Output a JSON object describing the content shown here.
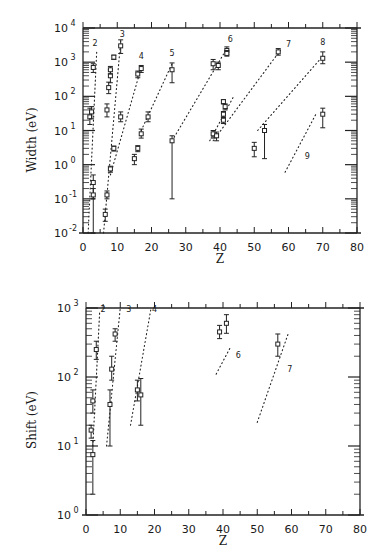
{
  "chart_data": [
    {
      "type": "scatter",
      "title": "",
      "xlabel": "Z",
      "ylabel": "Width (eV)",
      "xlim": [
        0,
        80
      ],
      "ylim": [
        0.01,
        10000
      ],
      "yscale": "log",
      "x_ticks": [
        "0",
        "10",
        "20",
        "30",
        "40",
        "50",
        "60",
        "70",
        "80"
      ],
      "y_ticks": [
        "10^-2",
        "10^-1",
        "10^0",
        "10^1",
        "10^2",
        "10^3",
        "10^4"
      ],
      "grid": false,
      "curve_labels": [
        "2",
        "3",
        "4",
        "5",
        "6",
        "7",
        "8",
        "9"
      ],
      "series": [
        {
          "name": "data",
          "points": [
            {
              "z": 2,
              "y": 25,
              "lo": 15,
              "hi": 45
            },
            {
              "z": 2.5,
              "y": 35,
              "lo": 22,
              "hi": 50
            },
            {
              "z": 3,
              "y": 700,
              "lo": 500,
              "hi": 900
            },
            {
              "z": 3,
              "y": 0.3,
              "lo": 0.1,
              "hi": 0.5
            },
            {
              "z": 3,
              "y": 0.13,
              "lo": 0.01,
              "hi": 0.2
            },
            {
              "z": 6.5,
              "y": 0.035,
              "lo": 0.022,
              "hi": 0.05
            },
            {
              "z": 7,
              "y": 0.13,
              "lo": 0.1,
              "hi": 0.17
            },
            {
              "z": 7,
              "y": 40,
              "lo": 25,
              "hi": 60
            },
            {
              "z": 7.5,
              "y": 180,
              "lo": 120,
              "hi": 260
            },
            {
              "z": 8,
              "y": 0.75,
              "lo": 0.6,
              "hi": 0.9
            },
            {
              "z": 8,
              "y": 400,
              "lo": 250,
              "hi": 600
            },
            {
              "z": 8,
              "y": 600,
              "lo": 450,
              "hi": 750
            },
            {
              "z": 9,
              "y": 1400,
              "lo": 1200,
              "hi": 1600
            },
            {
              "z": 9,
              "y": 3,
              "lo": 2.5,
              "hi": 3.5
            },
            {
              "z": 11,
              "y": 3000,
              "lo": 1800,
              "hi": 4500
            },
            {
              "z": 11,
              "y": 25,
              "lo": 18,
              "hi": 35
            },
            {
              "z": 15,
              "y": 1.5,
              "lo": 1,
              "hi": 2
            },
            {
              "z": 16,
              "y": 3,
              "lo": 2.4,
              "hi": 3.6
            },
            {
              "z": 17,
              "y": 8,
              "lo": 6,
              "hi": 11
            },
            {
              "z": 16,
              "y": 450,
              "lo": 350,
              "hi": 550
            },
            {
              "z": 17,
              "y": 650,
              "lo": 500,
              "hi": 800
            },
            {
              "z": 19,
              "y": 25,
              "lo": 18,
              "hi": 35
            },
            {
              "z": 26,
              "y": 5,
              "lo": 0.1,
              "hi": 7
            },
            {
              "z": 26,
              "y": 600,
              "lo": 250,
              "hi": 950
            },
            {
              "z": 38,
              "y": 8,
              "lo": 6,
              "hi": 10
            },
            {
              "z": 39,
              "y": 7,
              "lo": 5,
              "hi": 9
            },
            {
              "z": 38,
              "y": 900,
              "lo": 600,
              "hi": 1200
            },
            {
              "z": 39.5,
              "y": 800,
              "lo": 600,
              "hi": 1000
            },
            {
              "z": 41,
              "y": 70,
              "lo": 60,
              "hi": 80
            },
            {
              "z": 41.5,
              "y": 50,
              "lo": 40,
              "hi": 60
            },
            {
              "z": 41,
              "y": 30,
              "lo": 25,
              "hi": 36
            },
            {
              "z": 41,
              "y": 20,
              "lo": 16,
              "hi": 24
            },
            {
              "z": 42,
              "y": 2200,
              "lo": 1700,
              "hi": 2800
            },
            {
              "z": 42,
              "y": 1800,
              "lo": 1500,
              "hi": 2200
            },
            {
              "z": 50,
              "y": 3,
              "lo": 1.7,
              "hi": 4.5
            },
            {
              "z": 53,
              "y": 10,
              "lo": 1.5,
              "hi": 15
            },
            {
              "z": 57,
              "y": 2000,
              "lo": 1600,
              "hi": 2500
            },
            {
              "z": 70,
              "y": 1300,
              "lo": 900,
              "hi": 2000
            },
            {
              "z": 70,
              "y": 30,
              "lo": 12,
              "hi": 45
            }
          ]
        },
        {
          "name": "curve-2",
          "style": "dotted",
          "points": [
            [
              1.5,
              0.01
            ],
            [
              4,
              2000
            ]
          ]
        },
        {
          "name": "curve-3",
          "style": "dotted",
          "points": [
            [
              6,
              0.01
            ],
            [
              11,
              4000
            ]
          ]
        },
        {
          "name": "curve-4",
          "style": "dotted",
          "points": [
            [
              8,
              0.5
            ],
            [
              17,
              700
            ]
          ]
        },
        {
          "name": "curve-5",
          "style": "dotted",
          "points": [
            [
              17,
              10
            ],
            [
              26,
              900
            ]
          ]
        },
        {
          "name": "curve-6",
          "style": "dotted",
          "points": [
            [
              26,
              5
            ],
            [
              42,
              2500
            ]
          ]
        },
        {
          "name": "curve-6b",
          "style": "dotted",
          "points": [
            [
              37,
              5
            ],
            [
              44,
              100
            ]
          ]
        },
        {
          "name": "curve-7",
          "style": "dotted",
          "points": [
            [
              38,
              5
            ],
            [
              58,
              2500
            ]
          ]
        },
        {
          "name": "curve-8",
          "style": "dotted",
          "points": [
            [
              51,
              10
            ],
            [
              70,
              1500
            ]
          ]
        },
        {
          "name": "curve-9",
          "style": "dotted",
          "points": [
            [
              59,
              0.6
            ],
            [
              68,
              30
            ]
          ]
        }
      ]
    },
    {
      "type": "scatter",
      "title": "",
      "xlabel": "Z",
      "ylabel": "Shift (eV)",
      "xlim": [
        0,
        80
      ],
      "ylim": [
        1,
        1000
      ],
      "yscale": "log",
      "x_ticks": [
        "0",
        "10",
        "20",
        "30",
        "40",
        "50",
        "60",
        "70",
        "80"
      ],
      "y_ticks": [
        "10^0",
        "10^1",
        "10^2",
        "10^3"
      ],
      "grid": false,
      "curve_labels": [
        "2",
        "3",
        "4",
        "6",
        "7"
      ],
      "series": [
        {
          "name": "data",
          "points": [
            {
              "z": 1.5,
              "y": 17,
              "lo": 13,
              "hi": 20
            },
            {
              "z": 2,
              "y": 7.5,
              "lo": 2,
              "hi": 12
            },
            {
              "z": 2,
              "y": 45,
              "lo": 30,
              "hi": 65
            },
            {
              "z": 3,
              "y": 250,
              "lo": 180,
              "hi": 330
            },
            {
              "z": 7,
              "y": 40,
              "lo": 10,
              "hi": 65
            },
            {
              "z": 7.5,
              "y": 130,
              "lo": 90,
              "hi": 200
            },
            {
              "z": 8.5,
              "y": 420,
              "lo": 330,
              "hi": 500
            },
            {
              "z": 15,
              "y": 65,
              "lo": 45,
              "hi": 90
            },
            {
              "z": 16,
              "y": 55,
              "lo": 20,
              "hi": 95
            },
            {
              "z": 39,
              "y": 450,
              "lo": 360,
              "hi": 560
            },
            {
              "z": 41,
              "y": 600,
              "lo": 430,
              "hi": 800
            },
            {
              "z": 56,
              "y": 300,
              "lo": 200,
              "hi": 420
            }
          ]
        },
        {
          "name": "curve-2",
          "style": "dotted",
          "points": [
            [
              2,
              10
            ],
            [
              4,
              900
            ]
          ]
        },
        {
          "name": "curve-3",
          "style": "dotted",
          "points": [
            [
              6,
              10
            ],
            [
              10,
              1000
            ]
          ]
        },
        {
          "name": "curve-4",
          "style": "dotted",
          "points": [
            [
              13,
              20
            ],
            [
              19,
              1000
            ]
          ]
        },
        {
          "name": "curve-6",
          "style": "dotted",
          "points": [
            [
              38,
              110
            ],
            [
              42,
              260
            ]
          ]
        },
        {
          "name": "curve-7",
          "style": "dotted",
          "points": [
            [
              50,
              22
            ],
            [
              59,
              420
            ]
          ]
        }
      ]
    }
  ],
  "top_chart": {
    "ylabel": "Width (eV)",
    "xlabel": "Z",
    "x_ticks": [
      "0",
      "10",
      "20",
      "30",
      "40",
      "50",
      "60",
      "70",
      "80"
    ],
    "y_exponents": [
      "4",
      "3",
      "2",
      "1",
      "0",
      "-1",
      "-2"
    ],
    "curve_labels": [
      "2",
      "3",
      "4",
      "5",
      "6",
      "7",
      "8",
      "9"
    ]
  },
  "bottom_chart": {
    "ylabel": "Shift (eV)",
    "xlabel": "Z",
    "x_ticks": [
      "0",
      "10",
      "20",
      "30",
      "40",
      "50",
      "60",
      "70",
      "80"
    ],
    "y_exponents": [
      "3",
      "2",
      "1",
      "0"
    ],
    "curve_labels": [
      "2",
      "3",
      "4",
      "6",
      "7"
    ]
  }
}
